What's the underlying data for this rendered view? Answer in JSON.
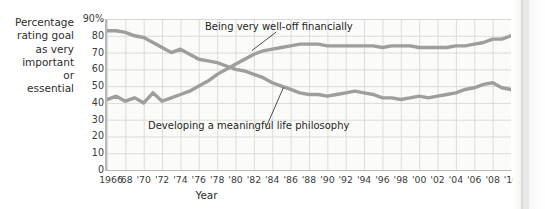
{
  "axis_label_lines": [
    "Percentage",
    "rating goal",
    "as very",
    "important",
    "or",
    "essential"
  ],
  "xtitle": "Year",
  "yticks": [
    "90%",
    "80",
    "70",
    "60",
    "50",
    "40",
    "30",
    "20",
    "10",
    "0"
  ],
  "xticks": [
    "1966",
    "'68",
    "'70",
    "'72",
    "'74",
    "'76",
    "'78",
    "'80",
    "'82",
    "'84",
    "'86",
    "'88",
    "'90",
    "'92",
    "'94",
    "'96",
    "'98",
    "'00",
    "'02",
    "'04",
    "'06",
    "'08",
    "'10"
  ],
  "annotations": {
    "wealth": "Being very well-off financially",
    "philosophy": "Developing a meaningful life philosophy"
  },
  "colors": {
    "line": "#9e9e9e",
    "grid": "#d8d8d6",
    "axis": "#b9b9b7",
    "plot_bg": "#fbfbfa",
    "text": "#2d2d2d"
  },
  "chart_data": {
    "type": "line",
    "title": "",
    "xlabel": "Year",
    "ylabel": "Percentage rating goal as very important or essential",
    "xlim": [
      1966,
      2010
    ],
    "ylim": [
      0,
      90
    ],
    "grid": true,
    "legend": "annotated-inline",
    "x": [
      1966,
      1967,
      1968,
      1969,
      1970,
      1971,
      1972,
      1973,
      1974,
      1975,
      1976,
      1977,
      1978,
      1979,
      1980,
      1981,
      1982,
      1983,
      1984,
      1985,
      1986,
      1987,
      1988,
      1989,
      1990,
      1991,
      1992,
      1993,
      1994,
      1995,
      1996,
      1997,
      1998,
      1999,
      2000,
      2001,
      2002,
      2003,
      2004,
      2005,
      2006,
      2007,
      2008,
      2009,
      2010
    ],
    "series": [
      {
        "name": "Being very well-off financially",
        "values": [
          42,
          44,
          41,
          43,
          40,
          46,
          41,
          43,
          45,
          47,
          50,
          53,
          57,
          60,
          63,
          66,
          69,
          71,
          72,
          73,
          74,
          75,
          75,
          75,
          74,
          74,
          74,
          74,
          74,
          74,
          73,
          74,
          74,
          74,
          73,
          73,
          73,
          73,
          74,
          74,
          75,
          76,
          78,
          78,
          80
        ]
      },
      {
        "name": "Developing a meaningful life philosophy",
        "values": [
          83,
          83,
          82,
          80,
          79,
          76,
          73,
          70,
          72,
          69,
          66,
          65,
          64,
          62,
          60,
          59,
          57,
          55,
          52,
          50,
          48,
          46,
          45,
          45,
          44,
          45,
          46,
          47,
          46,
          45,
          43,
          43,
          42,
          43,
          44,
          43,
          44,
          45,
          46,
          48,
          49,
          51,
          52,
          49,
          48
        ]
      }
    ]
  }
}
